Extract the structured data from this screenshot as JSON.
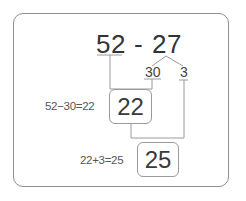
{
  "problem": {
    "minuend": "52",
    "operator": "-",
    "subtrahend": "27"
  },
  "decomposition": {
    "tens": "30",
    "ones": "3"
  },
  "steps": [
    {
      "equation": "52−30=22",
      "result": "22"
    },
    {
      "equation": "22+3=25",
      "result": "25"
    }
  ],
  "colors": {
    "line": "#9a9a9a",
    "text": "#333333",
    "frame": "#8f8f8f"
  }
}
